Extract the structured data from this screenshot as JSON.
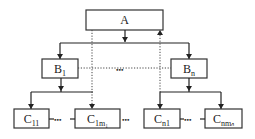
{
  "diagram": {
    "type": "hierarchy",
    "nodes": {
      "a": {
        "label": "A"
      },
      "b1": {
        "label": "B",
        "sub": "1"
      },
      "bn": {
        "label": "B",
        "sub": "n"
      },
      "c11": {
        "label": "C",
        "sub": "11"
      },
      "c1m1": {
        "label": "C",
        "sub": "1m₁"
      },
      "cn1": {
        "label": "C",
        "sub": "n1"
      },
      "cnmn": {
        "label": "C",
        "sub": "nmₙ"
      }
    },
    "ellipses": {
      "b_row": "•••",
      "c_left": "•••",
      "c_mid": "•••",
      "c_right": "•••"
    },
    "edges": [
      {
        "from": "A",
        "to": "B1",
        "style": "solid-arrow"
      },
      {
        "from": "A",
        "to": "Bn",
        "style": "solid-arrow"
      },
      {
        "from": "B1",
        "to": "C11",
        "style": "solid-arrow"
      },
      {
        "from": "B1",
        "to": "C1m1",
        "style": "solid-arrow"
      },
      {
        "from": "Bn",
        "to": "Cn1",
        "style": "solid-arrow"
      },
      {
        "from": "Bn",
        "to": "Cnmn",
        "style": "solid-arrow"
      },
      {
        "from": "A",
        "to": "C1m1",
        "style": "dotted-arrow"
      },
      {
        "from": "Cn1",
        "to": "A",
        "style": "dotted-arrow"
      },
      {
        "from": "B1",
        "to": "Bn",
        "style": "dotted"
      }
    ]
  }
}
